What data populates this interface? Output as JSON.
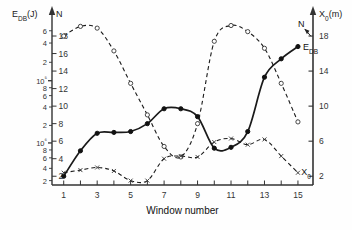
{
  "chart_data": {
    "type": "line",
    "title": "",
    "xlabel": "Window number",
    "ylabel_left_primary": "E_DB(J)",
    "ylabel_left_secondary": "N",
    "ylabel_right": "X₀(m)",
    "xlim": [
      0.3,
      15.9
    ],
    "xticks": [
      1,
      2,
      3,
      4,
      5,
      6,
      7,
      8,
      9,
      10,
      11,
      12,
      13,
      14,
      15
    ],
    "xticklabels": [
      "1",
      "",
      "3",
      "",
      "5",
      "",
      "7",
      "",
      "9",
      "",
      "11",
      "",
      "13",
      "",
      "15"
    ],
    "left_axis_N": {
      "label": "N",
      "lim": [
        1,
        19.6
      ],
      "ticks": [
        2,
        4,
        6,
        8,
        10,
        12,
        14,
        16,
        18
      ],
      "ticklabels": [
        "2",
        "4",
        "6",
        "8",
        "10",
        "12",
        "14",
        "16",
        "18"
      ]
    },
    "left_axis_EDB": {
      "label": "E_DB(J)",
      "scale": "log",
      "note": "logarithmic decade ticks aligned to the N linear axis",
      "ticklabels": [
        {
          "text": "6",
          "value": 18.6
        },
        {
          "text": "4",
          "value": 17.2
        },
        {
          "text": "2",
          "value": 15.0
        },
        {
          "text": "10⁵",
          "value": 12.9,
          "is_decade": true
        },
        {
          "text": "8",
          "value": 12.1
        },
        {
          "text": "6",
          "value": 11.2
        },
        {
          "text": "4",
          "value": 9.9
        },
        {
          "text": "2",
          "value": 7.8
        },
        {
          "text": "10⁶",
          "value": 5.8,
          "is_decade": true
        },
        {
          "text": "8",
          "value": 5.0
        },
        {
          "text": "6",
          "value": 4.1
        },
        {
          "text": "4",
          "value": 2.9
        },
        {
          "text": "2",
          "value": 1.5
        }
      ]
    },
    "right_axis": {
      "label": "X₀(m)",
      "lim": [
        1,
        19.6
      ],
      "ticks": [
        2,
        6,
        10,
        14,
        18
      ],
      "ticklabels": [
        "2",
        "6",
        "10",
        "14",
        "18"
      ]
    },
    "grid": false,
    "legend_position": "inline-annotations",
    "annotations": [
      {
        "text": "N",
        "x": 15.0,
        "y": 19.0,
        "arrow": "down-left"
      },
      {
        "text": "E_DB",
        "x": 15.3,
        "y": 16.4,
        "arrow": "none"
      },
      {
        "text": "X₀",
        "x": 15.2,
        "y": 2.1,
        "arrow": "none"
      }
    ],
    "series": [
      {
        "name": "E_DB",
        "style": "solid",
        "marker": "filled-circle",
        "x": [
          1,
          2,
          3,
          4,
          5,
          6,
          7,
          8,
          9,
          10,
          11,
          12,
          13,
          14,
          15
        ],
        "y": [
          2.0,
          4.9,
          6.9,
          7.0,
          7.1,
          8.0,
          9.7,
          9.7,
          8.8,
          5.2,
          5.3,
          7.1,
          13.3,
          15.4,
          16.8
        ]
      },
      {
        "name": "N",
        "style": "dashed",
        "marker": "open-circle",
        "x": [
          1,
          2,
          3,
          4,
          5,
          6,
          7,
          8,
          9,
          10,
          11,
          12,
          13,
          14,
          15
        ],
        "y": [
          18.0,
          19.1,
          18.9,
          16.3,
          12.6,
          9.0,
          5.4,
          4.2,
          8.0,
          17.4,
          19.2,
          18.5,
          16.6,
          12.6,
          8.2
        ]
      },
      {
        "name": "X0",
        "style": "dashed",
        "marker": "x-cross",
        "x": [
          1,
          2,
          3,
          4,
          5,
          6,
          7,
          8,
          9,
          10,
          11,
          12,
          13,
          14,
          15
        ],
        "y": [
          2.4,
          2.7,
          3.0,
          2.6,
          1.5,
          1.5,
          4.0,
          4.3,
          4.2,
          5.9,
          6.3,
          5.6,
          6.2,
          4.3,
          2.4
        ]
      }
    ]
  }
}
